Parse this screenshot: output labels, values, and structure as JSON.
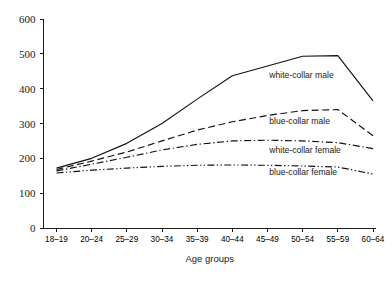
{
  "chart_data": {
    "type": "line",
    "title": "",
    "subtitle": "",
    "xlabel": "Age groups",
    "ylabel": "",
    "categories": [
      "18–19",
      "20–24",
      "25–29",
      "30–34",
      "35–39",
      "40–44",
      "45–49",
      "50–54",
      "55–59",
      "60–64"
    ],
    "ylim": [
      0,
      600
    ],
    "yticks": [
      0,
      100,
      200,
      300,
      400,
      500,
      600
    ],
    "grid": false,
    "legend_position": "inline-right-of-line",
    "series": [
      {
        "name": "white-collar male",
        "linestyle": "solid",
        "color": "#121212",
        "values": [
          172,
          200,
          243,
          300,
          370,
          437,
          465,
          493,
          495,
          365
        ],
        "label_x_index": 6.05,
        "label_y_value": 430
      },
      {
        "name": "blue-collar male",
        "linestyle": "dashed",
        "color": "#121212",
        "values": [
          168,
          192,
          218,
          250,
          281,
          305,
          323,
          337,
          340,
          265
        ],
        "label_x_index": 6.05,
        "label_y_value": 300
      },
      {
        "name": "white-collar female",
        "linestyle": "dashdot",
        "color": "#121212",
        "values": [
          164,
          183,
          203,
          224,
          240,
          250,
          252,
          250,
          245,
          228
        ],
        "label_x_index": 6.05,
        "label_y_value": 215
      },
      {
        "name": "blue-collar female",
        "linestyle": "dashdotdot",
        "color": "#121212",
        "values": [
          158,
          166,
          172,
          177,
          180,
          181,
          180,
          178,
          175,
          155
        ],
        "label_x_index": 6.05,
        "label_y_value": 152
      }
    ]
  },
  "axis": {
    "y_tick_labels": [
      "0",
      "100",
      "200",
      "300",
      "400",
      "500",
      "600"
    ],
    "x_tick_labels": [
      "18–19",
      "20–24",
      "25–29",
      "30–34",
      "35–39",
      "40–44",
      "45–49",
      "50–54",
      "55–59",
      "60–64"
    ],
    "x_axis_title": "Age groups"
  },
  "legend": {
    "entries": [
      "white-collar male",
      "blue-collar male",
      "white-collar female",
      "blue-collar female"
    ]
  }
}
